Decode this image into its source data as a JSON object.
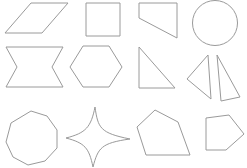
{
  "canvas": {
    "width": 247,
    "height": 168,
    "background_color": "#ffffff",
    "stroke_color": "#9a9a9a",
    "stroke_width": 1,
    "fill": "none",
    "description": "Grid of twelve outlined geometric shapes in three rows of four on a plain white background"
  },
  "shapes": [
    {
      "id": "parallelogram",
      "name": "parallelogram",
      "row": 1,
      "column": 1,
      "sides": 4,
      "type": "polygon",
      "points": "31,3 68,3 42,33 5,33"
    },
    {
      "id": "square",
      "name": "square",
      "row": 1,
      "column": 2,
      "sides": 4,
      "type": "polygon",
      "points": "86,3 120,3 120,36 86,36"
    },
    {
      "id": "trapezoid",
      "name": "right-trapezoid",
      "row": 1,
      "column": 3,
      "sides": 4,
      "type": "polygon",
      "points": "139,3 177,3 177,38 139,18"
    },
    {
      "id": "circle",
      "name": "circle",
      "row": 1,
      "column": 4,
      "sides": 0,
      "type": "circle",
      "cx": 215,
      "cy": 23,
      "r": 22.5
    },
    {
      "id": "concave-hexagon",
      "name": "concave-hexagon-bowtie",
      "row": 2,
      "column": 1,
      "sides": 6,
      "type": "polygon",
      "points": "6,47 63,47 52,67 63,87 6,87 17,67"
    },
    {
      "id": "hexagon",
      "name": "regular-hexagon",
      "row": 2,
      "column": 2,
      "sides": 6,
      "type": "polygon",
      "points": "83,46 109,46 122,67 109,87 83,87 70,67"
    },
    {
      "id": "right-triangle",
      "name": "right-triangle",
      "row": 2,
      "column": 3,
      "sides": 3,
      "type": "polygon",
      "points": "139,47 175,88 139,88"
    },
    {
      "id": "thin-triangle-left",
      "name": "narrow-triangle-left",
      "row": 2,
      "column": 4,
      "sides": 3,
      "type": "polygon",
      "points": "208,55 211,99 187,79"
    },
    {
      "id": "thin-triangle-right",
      "name": "narrow-triangle-right",
      "row": 2,
      "column": 4,
      "sides": 3,
      "type": "polygon",
      "points": "217,55 240,97 221,101"
    },
    {
      "id": "nonagon",
      "name": "nonagon",
      "row": 3,
      "column": 1,
      "sides": 9,
      "type": "polygon",
      "points": "31,111 47,116 57,130 57,148 45,161 28,165 13,157 6,142 11,123"
    },
    {
      "id": "four-point-star",
      "name": "four-pointed-star",
      "row": 3,
      "column": 2,
      "sides": 8,
      "type": "path",
      "d": "M 95,107 C 98,128 100,133 130,139 C 101,143 98,148 93,167 C 89,148 85,143 66,138 C 86,133 91,127 95,107 Z"
    },
    {
      "id": "pentagon",
      "name": "irregular-pentagon",
      "row": 3,
      "column": 3,
      "sides": 5,
      "type": "polygon",
      "points": "155,110 178,122 190,155 146,155 137,127"
    },
    {
      "id": "arrow-pentagon",
      "name": "right-pointing-pentagon",
      "row": 3,
      "column": 4,
      "sides": 5,
      "type": "polygon",
      "points": "206,118 229,115 244,134 226,150 206,150"
    }
  ]
}
